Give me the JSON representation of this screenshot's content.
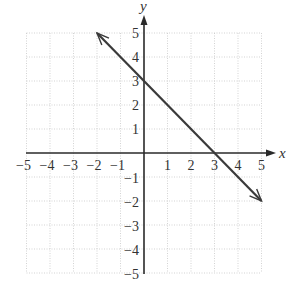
{
  "chart_data": {
    "type": "line",
    "title": "",
    "xlabel": "x",
    "ylabel": "y",
    "xlim": [
      -5,
      5
    ],
    "ylim": [
      -5,
      5
    ],
    "grid": true,
    "x_ticks": [
      -5,
      -4,
      -3,
      -2,
      -1,
      1,
      2,
      3,
      4,
      5
    ],
    "y_ticks": [
      -5,
      -4,
      -3,
      -2,
      -1,
      1,
      2,
      3,
      4,
      5
    ],
    "x_tick_labels": [
      "−5",
      "−4",
      "−3",
      "−2",
      "−1",
      "1",
      "2",
      "3",
      "4",
      "5"
    ],
    "y_tick_labels": [
      "5",
      "4",
      "3",
      "2",
      "1",
      "−1",
      "−2",
      "−3",
      "−4",
      "−5"
    ],
    "series": [
      {
        "name": "y = -x + 3",
        "equation": "y = -x + 3",
        "x": [
          -2,
          0,
          3,
          5
        ],
        "y": [
          5,
          3,
          0,
          -2
        ],
        "arrows_both_ends": true,
        "color": "#3a3a3a"
      }
    ],
    "intercepts": {
      "x_intercept": [
        3,
        0
      ],
      "y_intercept": [
        0,
        3
      ]
    }
  },
  "layout": {
    "origin_px": [
      144,
      153
    ],
    "unit_px_x": 23.5,
    "unit_px_y": 24
  }
}
